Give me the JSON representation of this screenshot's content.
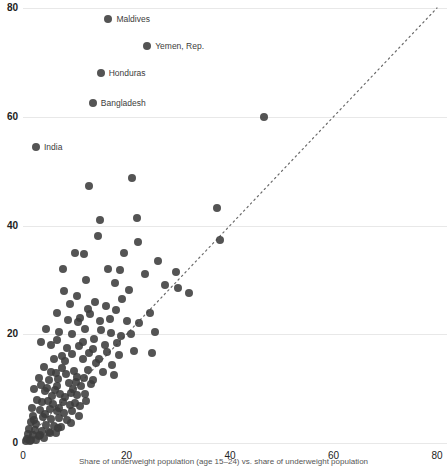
{
  "chart_data": {
    "type": "scatter",
    "title": "",
    "subtitle": "",
    "xlabel": "",
    "ylabel": "",
    "xlim": [
      0,
      80
    ],
    "ylim": [
      0,
      80
    ],
    "xticks": [
      0,
      20,
      40,
      60,
      80
    ],
    "yticks": [
      0,
      20,
      40,
      60,
      80
    ],
    "grid": "horizontal",
    "legend": "none",
    "reference_line": {
      "type": "identity",
      "style": "dotted",
      "from": [
        0,
        0
      ],
      "to": [
        80,
        80
      ]
    },
    "marker": {
      "shape": "circle",
      "color": "#3c3c3c",
      "size": 8,
      "opacity": 0.88
    },
    "annotations": [
      {
        "label": "Maldives",
        "x": 16.5,
        "y": 78.0
      },
      {
        "label": "Yemen, Rep.",
        "x": 24.0,
        "y": 73.0
      },
      {
        "label": "Honduras",
        "x": 15.0,
        "y": 68.0
      },
      {
        "label": "Bangladesh",
        "x": 13.5,
        "y": 62.5
      },
      {
        "label": "India",
        "x": 2.5,
        "y": 54.5
      }
    ],
    "points": [
      [
        16.5,
        78.0
      ],
      [
        24.0,
        73.0
      ],
      [
        15.0,
        68.0
      ],
      [
        13.5,
        62.5
      ],
      [
        2.5,
        54.5
      ],
      [
        46.5,
        60.0
      ],
      [
        12.8,
        47.3
      ],
      [
        21.0,
        48.8
      ],
      [
        37.5,
        43.2
      ],
      [
        22.0,
        41.4
      ],
      [
        14.8,
        41.0
      ],
      [
        38.0,
        37.4
      ],
      [
        14.5,
        38.0
      ],
      [
        22.2,
        37.0
      ],
      [
        19.5,
        35.0
      ],
      [
        10.0,
        35.0
      ],
      [
        11.8,
        34.8
      ],
      [
        26.0,
        33.5
      ],
      [
        29.5,
        31.5
      ],
      [
        7.8,
        32.0
      ],
      [
        16.5,
        32.0
      ],
      [
        18.8,
        31.8
      ],
      [
        12.2,
        30.0
      ],
      [
        20.5,
        28.2
      ],
      [
        32.0,
        27.5
      ],
      [
        8.0,
        28.0
      ],
      [
        10.5,
        27.0
      ],
      [
        9.0,
        25.5
      ],
      [
        14.0,
        26.0
      ],
      [
        16.0,
        25.2
      ],
      [
        18.0,
        24.5
      ],
      [
        13.0,
        23.8
      ],
      [
        11.0,
        23.0
      ],
      [
        20.0,
        22.5
      ],
      [
        22.5,
        22.0
      ],
      [
        24.5,
        24.0
      ],
      [
        6.5,
        24.0
      ],
      [
        4.5,
        21.0
      ],
      [
        7.0,
        20.5
      ],
      [
        9.5,
        20.0
      ],
      [
        12.0,
        21.0
      ],
      [
        15.0,
        20.8
      ],
      [
        17.0,
        20.2
      ],
      [
        19.0,
        19.6
      ],
      [
        21.5,
        17.0
      ],
      [
        3.5,
        18.5
      ],
      [
        5.5,
        18.0
      ],
      [
        8.5,
        17.5
      ],
      [
        10.8,
        17.8
      ],
      [
        13.5,
        17.2
      ],
      [
        16.2,
        16.8
      ],
      [
        18.5,
        16.2
      ],
      [
        6.0,
        15.5
      ],
      [
        8.2,
        15.0
      ],
      [
        11.5,
        15.5
      ],
      [
        14.2,
        14.8
      ],
      [
        4.0,
        14.0
      ],
      [
        7.5,
        13.8
      ],
      [
        9.8,
        13.2
      ],
      [
        12.5,
        13.5
      ],
      [
        15.5,
        13.0
      ],
      [
        17.5,
        12.5
      ],
      [
        3.0,
        12.0
      ],
      [
        5.0,
        11.5
      ],
      [
        6.8,
        11.8
      ],
      [
        8.8,
        11.0
      ],
      [
        10.2,
        11.2
      ],
      [
        11.2,
        10.5
      ],
      [
        13.2,
        10.8
      ],
      [
        2.2,
        10.0
      ],
      [
        4.2,
        9.5
      ],
      [
        6.2,
        9.8
      ],
      [
        7.2,
        9.0
      ],
      [
        9.2,
        9.2
      ],
      [
        10.5,
        8.8
      ],
      [
        12.0,
        9.0
      ],
      [
        2.8,
        8.0
      ],
      [
        4.8,
        7.8
      ],
      [
        5.8,
        7.2
      ],
      [
        7.8,
        7.5
      ],
      [
        9.0,
        7.0
      ],
      [
        10.0,
        7.4
      ],
      [
        11.0,
        6.8
      ],
      [
        1.8,
        6.5
      ],
      [
        3.2,
        6.0
      ],
      [
        5.2,
        6.2
      ],
      [
        6.5,
        5.8
      ],
      [
        8.0,
        5.5
      ],
      [
        9.5,
        5.8
      ],
      [
        2.0,
        5.0
      ],
      [
        3.8,
        4.8
      ],
      [
        5.5,
        4.5
      ],
      [
        7.0,
        4.6
      ],
      [
        8.5,
        4.2
      ],
      [
        1.5,
        3.8
      ],
      [
        2.6,
        3.5
      ],
      [
        4.4,
        3.4
      ],
      [
        6.0,
        3.2
      ],
      [
        7.4,
        3.0
      ],
      [
        1.2,
        2.6
      ],
      [
        2.4,
        2.4
      ],
      [
        3.6,
        2.2
      ],
      [
        5.0,
        2.0
      ],
      [
        6.4,
        1.9
      ],
      [
        1.0,
        1.6
      ],
      [
        2.0,
        1.4
      ],
      [
        3.0,
        1.2
      ],
      [
        4.0,
        1.0
      ],
      [
        0.8,
        0.8
      ],
      [
        1.6,
        0.6
      ],
      [
        2.5,
        0.5
      ],
      [
        0.5,
        0.4
      ],
      [
        1.3,
        0.3
      ],
      [
        25.5,
        20.5
      ],
      [
        27.5,
        29.0
      ],
      [
        30.0,
        28.5
      ],
      [
        23.5,
        31.0
      ],
      [
        25.0,
        16.5
      ],
      [
        17.8,
        29.5
      ],
      [
        19.2,
        26.5
      ],
      [
        12.6,
        24.6
      ],
      [
        14.8,
        22.4
      ],
      [
        16.8,
        22.8
      ],
      [
        10.6,
        22.2
      ],
      [
        8.6,
        22.6
      ],
      [
        6.6,
        19.0
      ],
      [
        18.2,
        18.4
      ],
      [
        20.8,
        20.0
      ],
      [
        13.8,
        19.2
      ],
      [
        11.6,
        18.6
      ],
      [
        15.8,
        18.0
      ],
      [
        9.4,
        16.4
      ],
      [
        7.6,
        16.0
      ],
      [
        12.8,
        16.6
      ],
      [
        14.6,
        15.4
      ],
      [
        17.2,
        14.4
      ],
      [
        5.4,
        13.0
      ],
      [
        3.4,
        10.6
      ],
      [
        8.4,
        12.6
      ],
      [
        10.4,
        12.2
      ],
      [
        6.4,
        12.8
      ],
      [
        11.8,
        12.0
      ],
      [
        13.6,
        11.6
      ],
      [
        4.6,
        10.2
      ],
      [
        6.6,
        10.4
      ],
      [
        9.6,
        10.0
      ],
      [
        12.2,
        7.8
      ],
      [
        8.2,
        8.4
      ],
      [
        5.6,
        8.6
      ],
      [
        3.6,
        7.6
      ],
      [
        7.0,
        6.4
      ],
      [
        4.2,
        5.4
      ],
      [
        2.2,
        4.2
      ],
      [
        10.8,
        5.0
      ],
      [
        9.2,
        3.6
      ],
      [
        6.8,
        2.8
      ],
      [
        5.2,
        1.8
      ],
      [
        3.2,
        1.5
      ]
    ]
  },
  "axis": {
    "x_tick_labels": [
      "0",
      "20",
      "40",
      "60",
      "80"
    ],
    "y_tick_labels": [
      "0",
      "20",
      "40",
      "60",
      "80"
    ]
  },
  "caption": {
    "text": "Share of underweight population (age 15–24) vs. share of underweight population"
  }
}
